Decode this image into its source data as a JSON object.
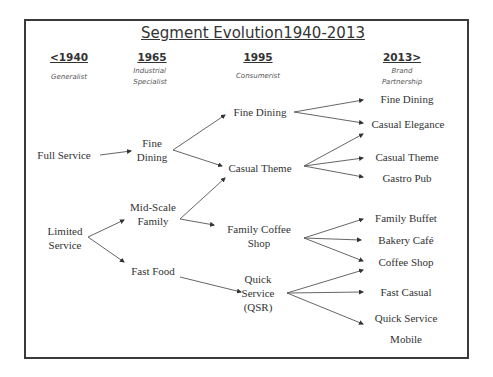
{
  "title": "Segment Evolution1940-2013",
  "columns": [
    {
      "year": "<1940",
      "era_line1": "Generalist",
      "era_line2": ""
    },
    {
      "year": "1965",
      "era_line1": "Industrial",
      "era_line2": "Specialist"
    },
    {
      "year": "1995",
      "era_line1": "Consumerist",
      "era_line2": ""
    },
    {
      "year": "2013>",
      "era_line1": "Brand",
      "era_line2": "Partnership"
    }
  ],
  "nodes": {
    "c1940": {
      "full_service": "Full Service",
      "limited_line1": "Limited",
      "limited_line2": "Service"
    },
    "c1965": {
      "fine_line1": "Fine",
      "fine_line2": "Dining",
      "midscale_line1": "Mid-Scale",
      "midscale_line2": "Family",
      "fast_food": "Fast Food"
    },
    "c1995": {
      "fine_dining": "Fine Dining",
      "casual_theme": "Casual Theme",
      "family_line1": "Family Coffee",
      "family_line2": "Shop",
      "qsr_line1": "Quick",
      "qsr_line2": "Service",
      "qsr_line3": "(QSR)"
    },
    "c2013": [
      "Fine Dining",
      "Casual Elegance",
      "Casual Theme",
      "Gastro Pub",
      "Family Buffet",
      "Bakery Café",
      "Coffee Shop",
      "Fast Casual",
      "Quick Service",
      "Mobile"
    ]
  },
  "edges": [
    {
      "from": "Full Service",
      "to": "Fine Dining (1965)"
    },
    {
      "from": "Limited Service",
      "to": "Mid-Scale Family"
    },
    {
      "from": "Limited Service",
      "to": "Fast Food"
    },
    {
      "from": "Fine Dining (1965)",
      "to": "Fine Dining (1995)"
    },
    {
      "from": "Fine Dining (1965)",
      "to": "Casual Theme (1995)"
    },
    {
      "from": "Mid-Scale Family",
      "to": "Casual Theme (1995)"
    },
    {
      "from": "Mid-Scale Family",
      "to": "Family Coffee Shop"
    },
    {
      "from": "Fast Food",
      "to": "Quick Service (QSR)"
    },
    {
      "from": "Fine Dining (1995)",
      "to": "Fine Dining (2013)"
    },
    {
      "from": "Fine Dining (1995)",
      "to": "Casual Elegance"
    },
    {
      "from": "Casual Theme (1995)",
      "to": "Casual Elegance"
    },
    {
      "from": "Casual Theme (1995)",
      "to": "Casual Theme (2013)"
    },
    {
      "from": "Casual Theme (1995)",
      "to": "Gastro Pub"
    },
    {
      "from": "Family Coffee Shop",
      "to": "Family Buffet"
    },
    {
      "from": "Family Coffee Shop",
      "to": "Bakery Café"
    },
    {
      "from": "Family Coffee Shop",
      "to": "Coffee Shop"
    },
    {
      "from": "Quick Service (QSR)",
      "to": "Coffee Shop"
    },
    {
      "from": "Quick Service (QSR)",
      "to": "Fast Casual"
    },
    {
      "from": "Quick Service (QSR)",
      "to": "Quick Service (2013)"
    }
  ],
  "colors": {
    "frame": "#3a3a3a",
    "text": "#333333",
    "arrow": "#555555"
  }
}
